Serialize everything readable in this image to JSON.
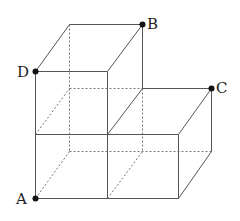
{
  "figure": {
    "colors": {
      "background": "#ffffff",
      "solid_edge": "#555555",
      "hidden_edge": "#777777",
      "point": "#111111",
      "label": "#222222"
    },
    "points": [
      {
        "label": "A",
        "x": 35,
        "y": 198,
        "label_x": 16,
        "label_y": 204
      },
      {
        "label": "B",
        "x": 142,
        "y": 24,
        "label_x": 147,
        "label_y": 29
      },
      {
        "label": "C",
        "x": 211,
        "y": 88,
        "label_x": 216,
        "label_y": 93
      },
      {
        "label": "D",
        "x": 35,
        "y": 71,
        "label_x": 17,
        "label_y": 77
      }
    ],
    "solid_edges": [
      [
        35,
        71,
        107,
        71
      ],
      [
        35,
        71,
        69,
        24
      ],
      [
        69,
        24,
        142,
        24
      ],
      [
        107,
        71,
        142,
        24
      ],
      [
        142,
        24,
        142,
        88
      ],
      [
        35,
        71,
        35,
        198
      ],
      [
        107,
        71,
        107,
        198
      ],
      [
        35,
        134,
        178,
        134
      ],
      [
        35,
        198,
        178,
        198
      ],
      [
        107,
        134,
        142,
        88
      ],
      [
        142,
        88,
        211,
        88
      ],
      [
        178,
        134,
        211,
        88
      ],
      [
        178,
        134,
        178,
        198
      ],
      [
        211,
        88,
        211,
        151
      ],
      [
        178,
        198,
        211,
        151
      ]
    ],
    "hidden_edges": [
      [
        69,
        24,
        69,
        151
      ],
      [
        142,
        88,
        142,
        151
      ],
      [
        69,
        88,
        142,
        88
      ],
      [
        69,
        151,
        211,
        151
      ],
      [
        35,
        134,
        69,
        88
      ],
      [
        35,
        198,
        69,
        151
      ],
      [
        107,
        198,
        142,
        151
      ]
    ]
  }
}
